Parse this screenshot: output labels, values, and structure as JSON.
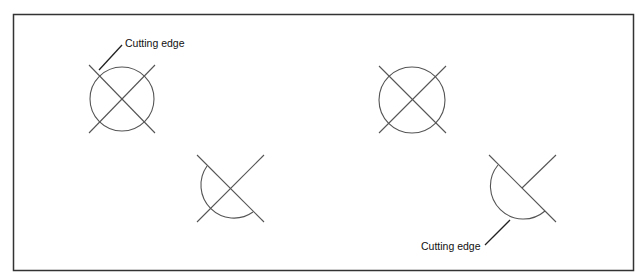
{
  "diagram": {
    "labels": {
      "top_left": "Cutting edge",
      "bottom_right": "Cutting edge"
    },
    "colors": {
      "frame": "#333333",
      "lines": "#555555",
      "text": "#111111"
    },
    "figures": [
      {
        "name": "full-circle-crossed-1",
        "center": [
          122,
          99
        ],
        "radius": 32
      },
      {
        "name": "full-circle-crossed-2",
        "center": [
          412,
          100
        ],
        "radius": 33
      },
      {
        "name": "half-circle-crossed-1",
        "center": [
          230,
          189
        ],
        "radius": 33
      },
      {
        "name": "half-circle-crossed-2",
        "center": [
          522,
          188
        ],
        "radius": 33
      }
    ]
  }
}
